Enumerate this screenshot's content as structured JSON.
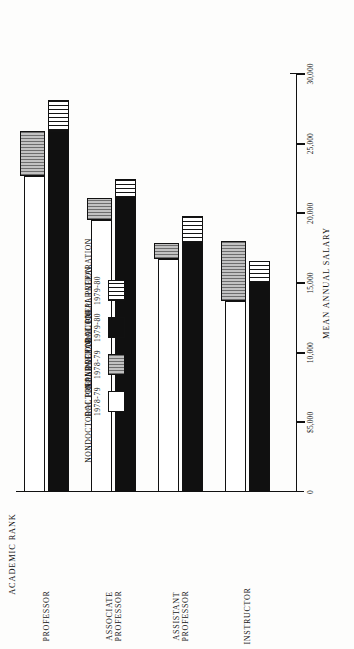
{
  "chart_data": {
    "type": "bar",
    "title": "",
    "orientation": "horizontal-rotated",
    "xlabel": "ACADEMIC RANK",
    "ylabel": "MEAN ANNUAL SALARY",
    "ylim": [
      0,
      30000
    ],
    "grid": false,
    "legend_position": "top-center",
    "tick_labels": [
      "0",
      "$5,000",
      "10,000",
      "15,000",
      "20,000",
      "25,000",
      "30,000"
    ],
    "tick_values": [
      0,
      5000,
      10000,
      15000,
      20000,
      25000,
      30000
    ],
    "categories": [
      "PROFESSOR",
      "ASSOCIATE PROFESSOR",
      "ASSISTANT PROFESSOR",
      "INSTRUCTOR"
    ],
    "category_lines": [
      [
        "PROFESSOR"
      ],
      [
        "ASSOCIATE",
        "PROFESSOR"
      ],
      [
        "ASSISTANT",
        "PROFESSOR"
      ],
      [
        "INSTRUCTOR"
      ]
    ],
    "series": [
      {
        "name": "NONDOCTORAL PREPARATION 1978-79",
        "label_lines": [
          "NONDOCTORAL PREPARATION",
          "1978-79"
        ],
        "swatch": "white",
        "values": [
          22700,
          19500,
          16700,
          13700
        ]
      },
      {
        "name": "DOCTORAL PREPARATION 1978-79",
        "label_lines": [
          "DOCTORAL PREPARATION",
          "1978-79"
        ],
        "swatch": "gray-ruled",
        "values": [
          25900,
          21100,
          17900,
          18000
        ]
      },
      {
        "name": "NONDOCTORAL PREPARATION 1979-80",
        "label_lines": [
          "NONDOCTORAL PREPARATION",
          "1979-80"
        ],
        "swatch": "black",
        "values": [
          25900,
          21100,
          17900,
          15000
        ]
      },
      {
        "name": "DOCTORAL PREPARATION 1979-80",
        "label_lines": [
          "DOCTORAL PREPARATION",
          "1979-80"
        ],
        "swatch": "white-ruled",
        "values": [
          28100,
          22500,
          19800,
          16600
        ]
      }
    ],
    "colors": {
      "ink": "#111111",
      "white_fill": "#ffffff",
      "black_fill": "#101010",
      "gray_fill": "#a9a9a9"
    }
  }
}
